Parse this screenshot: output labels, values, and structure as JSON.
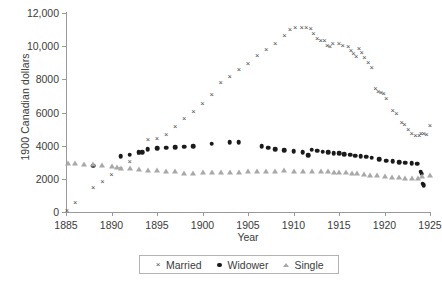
{
  "chart_data": {
    "type": "scatter",
    "title": "",
    "xlabel": "Year",
    "ylabel": "1900 Canadian dollars",
    "xlim": [
      1885,
      1925
    ],
    "ylim": [
      0,
      12000
    ],
    "xticks": [
      1885,
      1890,
      1895,
      1900,
      1905,
      1910,
      1915,
      1920,
      1925
    ],
    "xtick_labels": [
      "1885",
      "1890",
      "1895",
      "1900",
      "1905",
      "1910",
      "1915",
      "1920",
      "1925"
    ],
    "yticks": [
      0,
      2000,
      4000,
      6000,
      8000,
      10000,
      12000
    ],
    "ytick_labels": [
      "0",
      "2000",
      "4000",
      "6000",
      "8000",
      "10,000",
      "12,000"
    ],
    "grid": false,
    "legend_position": "bottom-center",
    "series": [
      {
        "name": "Married",
        "marker": "x",
        "color": "#4a4a4a",
        "points": [
          [
            1885.1,
            60
          ],
          [
            1886.0,
            560
          ],
          [
            1888.0,
            1420
          ],
          [
            1889.0,
            1830
          ],
          [
            1890.0,
            2220
          ],
          [
            1891.0,
            2620
          ],
          [
            1892.0,
            3020
          ],
          [
            1893.0,
            3500
          ],
          [
            1894.0,
            4330
          ],
          [
            1895.0,
            4380
          ],
          [
            1896.0,
            4650
          ],
          [
            1897.0,
            5150
          ],
          [
            1898.0,
            5580
          ],
          [
            1899.0,
            6060
          ],
          [
            1900.0,
            6500
          ],
          [
            1901.0,
            7030
          ],
          [
            1902.0,
            7780
          ],
          [
            1903.0,
            8150
          ],
          [
            1904.0,
            8550
          ],
          [
            1905.0,
            8950
          ],
          [
            1906.0,
            9400
          ],
          [
            1907.0,
            9750
          ],
          [
            1908.0,
            10150
          ],
          [
            1909.0,
            10600
          ],
          [
            1909.6,
            10950
          ],
          [
            1910.2,
            11080
          ],
          [
            1910.9,
            11100
          ],
          [
            1911.4,
            11080
          ],
          [
            1911.9,
            11060
          ],
          [
            1912.2,
            10720
          ],
          [
            1912.6,
            10450
          ],
          [
            1913.0,
            10300
          ],
          [
            1913.4,
            10300
          ],
          [
            1913.7,
            9980
          ],
          [
            1914.0,
            9960
          ],
          [
            1914.3,
            10160
          ],
          [
            1915.0,
            10150
          ],
          [
            1915.4,
            9980
          ],
          [
            1916.0,
            9960
          ],
          [
            1916.3,
            9700
          ],
          [
            1916.6,
            9520
          ],
          [
            1916.9,
            9350
          ],
          [
            1917.2,
            9800
          ],
          [
            1917.5,
            9600
          ],
          [
            1917.8,
            9300
          ],
          [
            1918.2,
            8980
          ],
          [
            1918.6,
            8700
          ],
          [
            1919.0,
            7400
          ],
          [
            1919.3,
            7250
          ],
          [
            1919.6,
            7180
          ],
          [
            1919.9,
            7120
          ],
          [
            1920.2,
            6800
          ],
          [
            1920.9,
            6080
          ],
          [
            1921.3,
            5880
          ],
          [
            1921.9,
            5380
          ],
          [
            1922.2,
            5260
          ],
          [
            1922.6,
            4950
          ],
          [
            1923.0,
            4720
          ],
          [
            1923.4,
            4600
          ],
          [
            1923.8,
            4580
          ],
          [
            1924.0,
            4700
          ],
          [
            1924.3,
            4700
          ],
          [
            1924.6,
            4620
          ],
          [
            1925.0,
            5180
          ]
        ]
      },
      {
        "name": "Widower",
        "marker": "o",
        "color": "#1a1a1a",
        "points": [
          [
            1888.0,
            2800
          ],
          [
            1891.0,
            3370
          ],
          [
            1892.0,
            3450
          ],
          [
            1893.0,
            3600
          ],
          [
            1893.4,
            3620
          ],
          [
            1894.0,
            3790
          ],
          [
            1895.0,
            3830
          ],
          [
            1896.0,
            3880
          ],
          [
            1897.0,
            3900
          ],
          [
            1898.0,
            3930
          ],
          [
            1899.0,
            3970
          ],
          [
            1901.0,
            4110
          ],
          [
            1903.0,
            4220
          ],
          [
            1904.0,
            4200
          ],
          [
            1906.5,
            3980
          ],
          [
            1907.2,
            3880
          ],
          [
            1908.0,
            3800
          ],
          [
            1909.0,
            3740
          ],
          [
            1910.0,
            3680
          ],
          [
            1911.0,
            3600
          ],
          [
            1911.6,
            3420
          ],
          [
            1912.0,
            3760
          ],
          [
            1912.6,
            3700
          ],
          [
            1913.2,
            3640
          ],
          [
            1913.8,
            3600
          ],
          [
            1914.4,
            3560
          ],
          [
            1915.0,
            3540
          ],
          [
            1915.6,
            3500
          ],
          [
            1916.2,
            3460
          ],
          [
            1916.8,
            3400
          ],
          [
            1917.4,
            3360
          ],
          [
            1918.0,
            3330
          ],
          [
            1918.6,
            3280
          ],
          [
            1919.4,
            3180
          ],
          [
            1920.2,
            3100
          ],
          [
            1920.9,
            3060
          ],
          [
            1921.6,
            3020
          ],
          [
            1922.3,
            2980
          ],
          [
            1923.0,
            2950
          ],
          [
            1923.6,
            2920
          ],
          [
            1924.0,
            2420
          ],
          [
            1924.1,
            2300
          ],
          [
            1924.2,
            1700
          ],
          [
            1924.3,
            1620
          ]
        ]
      },
      {
        "name": "Single",
        "marker": "^",
        "color": "#a8a8a8",
        "points": [
          [
            1885.2,
            2900
          ],
          [
            1886.0,
            2870
          ],
          [
            1887.0,
            2840
          ],
          [
            1888.0,
            2820
          ],
          [
            1889.0,
            2760
          ],
          [
            1890.0,
            2700
          ],
          [
            1890.6,
            2640
          ],
          [
            1891.0,
            2580
          ],
          [
            1892.0,
            2600
          ],
          [
            1893.0,
            2520
          ],
          [
            1894.0,
            2480
          ],
          [
            1895.0,
            2460
          ],
          [
            1896.0,
            2440
          ],
          [
            1897.0,
            2430
          ],
          [
            1898.0,
            2280
          ],
          [
            1899.0,
            2320
          ],
          [
            1900.0,
            2340
          ],
          [
            1901.0,
            2330
          ],
          [
            1902.0,
            2340
          ],
          [
            1903.0,
            2360
          ],
          [
            1904.0,
            2380
          ],
          [
            1905.0,
            2400
          ],
          [
            1906.0,
            2420
          ],
          [
            1907.0,
            2430
          ],
          [
            1908.0,
            2440
          ],
          [
            1909.0,
            2450
          ],
          [
            1910.0,
            2440
          ],
          [
            1911.0,
            2420
          ],
          [
            1912.0,
            2400
          ],
          [
            1913.0,
            2400
          ],
          [
            1913.8,
            2420
          ],
          [
            1914.4,
            2380
          ],
          [
            1915.0,
            2360
          ],
          [
            1915.8,
            2340
          ],
          [
            1916.4,
            2300
          ],
          [
            1917.0,
            2280
          ],
          [
            1917.8,
            2250
          ],
          [
            1918.4,
            2200
          ],
          [
            1919.2,
            2160
          ],
          [
            1920.0,
            2100
          ],
          [
            1920.8,
            2060
          ],
          [
            1921.6,
            2030
          ],
          [
            1922.3,
            2020
          ],
          [
            1923.0,
            2000
          ],
          [
            1923.7,
            1980
          ],
          [
            1924.1,
            2140
          ],
          [
            1925.0,
            2180
          ]
        ]
      }
    ]
  },
  "legend": {
    "items": [
      {
        "label": "Married",
        "marker": "x"
      },
      {
        "label": "Widower",
        "marker": "o"
      },
      {
        "label": "Single",
        "marker": "^"
      }
    ]
  },
  "markers": {
    "cross_glyph": "×"
  }
}
